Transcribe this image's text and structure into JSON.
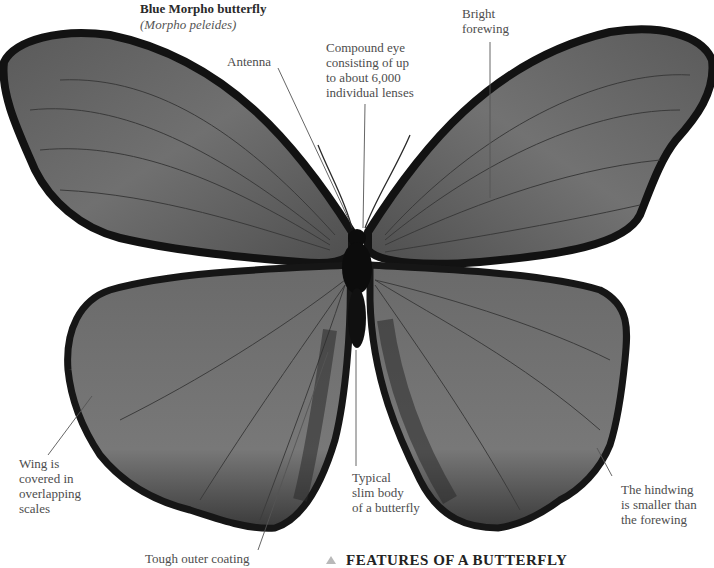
{
  "title": {
    "common_name": "Blue Morpho butterfly",
    "scientific_name": "(Morpho peleides)"
  },
  "labels": {
    "antenna": "Antenna",
    "compound_eye": [
      "Compound eye",
      "consisting of up",
      "to about 6,000",
      "individual lenses"
    ],
    "bright_forewing": [
      "Bright",
      "forewing"
    ],
    "wing_scales": [
      "Wing is",
      "covered in",
      "overlapping",
      "scales"
    ],
    "slim_body": [
      "Typical",
      "slim body",
      "of a butterfly"
    ],
    "hindwing": [
      "The hindwing",
      "is smaller than",
      "the forewing"
    ],
    "outer_coating": "Tough outer coating"
  },
  "section_heading": "FEATURES OF A BUTTERFLY",
  "colors": {
    "wing_fill": "#6e6e6e",
    "wing_edge": "#141414",
    "body": "#0c0c0c",
    "leader_line": "#555555",
    "heading_marker": "#b9b9b9"
  }
}
